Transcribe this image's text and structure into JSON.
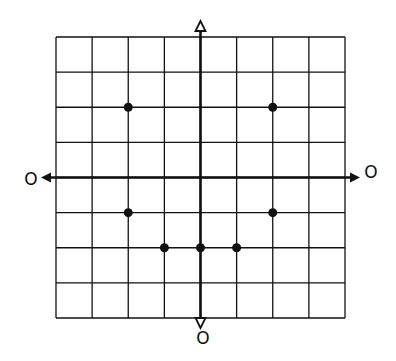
{
  "chart_data": {
    "type": "scatter",
    "title": "",
    "xlabel": "O",
    "ylabel": "O",
    "axis_end_labels": {
      "left": "O",
      "right": "O",
      "bottom": "O",
      "top": ""
    },
    "xlim": [
      -4,
      4
    ],
    "ylim": [
      -4,
      4
    ],
    "grid": true,
    "grid_cells": 8,
    "points": [
      {
        "x": -2,
        "y": 2
      },
      {
        "x": 2,
        "y": 2
      },
      {
        "x": -2,
        "y": -1
      },
      {
        "x": 2,
        "y": -1
      },
      {
        "x": -1,
        "y": -2
      },
      {
        "x": 0,
        "y": -2
      },
      {
        "x": 1,
        "y": -2
      }
    ],
    "colors": {
      "ink": "#111111",
      "background": "#ffffff"
    }
  },
  "labels": {
    "left": "O",
    "right": "O",
    "bottom": "O"
  }
}
